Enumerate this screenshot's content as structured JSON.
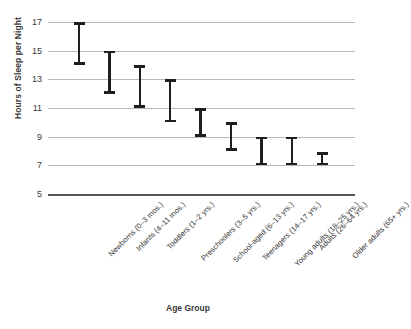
{
  "chart_data": {
    "type": "bar",
    "title": "",
    "subtitle": "",
    "xlabel": "Age Group",
    "ylabel": "Hours of Sleep per Night",
    "ylim": [
      5,
      17
    ],
    "yticks": [
      17,
      15,
      13,
      11,
      9,
      7,
      5
    ],
    "grid": true,
    "legend": "none",
    "series_style": "range-error-bars",
    "categories": [
      "Newborns (0–3 mos.)",
      "Infants (4–11 mos.)",
      "Toddlers (1–2 yrs.)",
      "Preschoolers (3–5 yrs.)",
      "School-aged (6–13 yrs.)",
      "Teenagers (14–17 yrs.)",
      "Young adults (18–25 yrs.)",
      "Adults (26–64 yrs.)",
      "Older adults (65+ yrs.)"
    ],
    "series": [
      {
        "name": "Recommended hours of sleep",
        "low": [
          14,
          12,
          11,
          10,
          9,
          8,
          7,
          7,
          7
        ],
        "high": [
          17,
          15,
          14,
          13,
          11,
          10,
          9,
          9,
          7.9
        ]
      }
    ],
    "points": [
      {
        "category": "Newborns (0–3 mos.)",
        "low": 14,
        "high": 17
      },
      {
        "category": "Infants (4–11 mos.)",
        "low": 12,
        "high": 15
      },
      {
        "category": "Toddlers (1–2 yrs.)",
        "low": 11,
        "high": 14
      },
      {
        "category": "Preschoolers (3–5 yrs.)",
        "low": 10,
        "high": 13
      },
      {
        "category": "School-aged (6–13 yrs.)",
        "low": 9,
        "high": 11
      },
      {
        "category": "Teenagers (14–17 yrs.)",
        "low": 8,
        "high": 10
      },
      {
        "category": "Young adults (18–25 yrs.)",
        "low": 7,
        "high": 9
      },
      {
        "category": "Adults (26–64 yrs.)",
        "low": 7,
        "high": 9
      },
      {
        "category": "Older adults (65+ yrs.)",
        "low": 7,
        "high": 7.9
      }
    ],
    "colors": {
      "bar": "#1f1f1f",
      "gridline": "#b9b9b9",
      "baseline": "#555555",
      "text": "#343434",
      "background": "#ffffff"
    }
  }
}
